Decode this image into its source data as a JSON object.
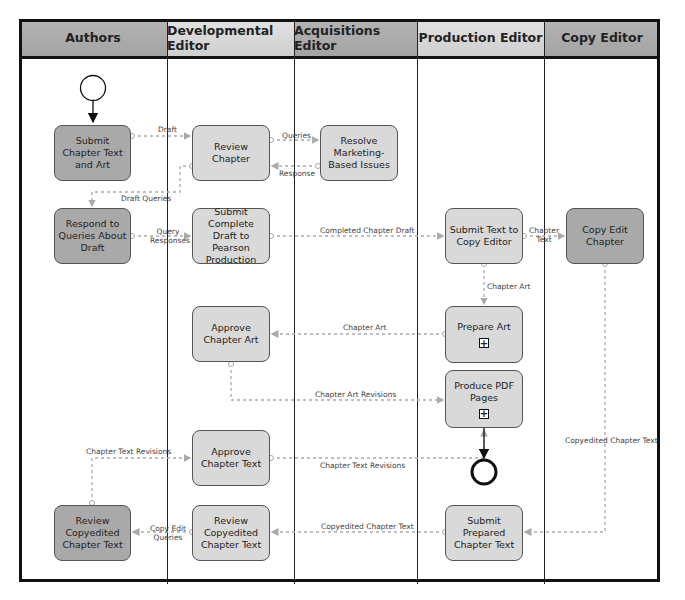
{
  "lanes": [
    {
      "name": "Authors",
      "shade": "dark"
    },
    {
      "name": "Developmental Editor",
      "shade": "light"
    },
    {
      "name": "Acquisitions Editor",
      "shade": "dark"
    },
    {
      "name": "Production Editor",
      "shade": "light"
    },
    {
      "name": "Copy Editor",
      "shade": "dark"
    }
  ],
  "tasks": {
    "submit_chapter": "Submit Chapter Text and Art",
    "review_chapter": "Review Chapter",
    "resolve_marketing": "Resolve Marketing-Based Issues",
    "respond_queries": "Respond to Queries About Draft",
    "submit_complete_draft": "Submit Complete Draft to Pearson Production",
    "submit_text_copy": "Submit Text to Copy Editor",
    "copy_edit": "Copy Edit Chapter",
    "approve_art": "Approve Chapter Art",
    "prepare_art": "Prepare Art",
    "produce_pdf": "Produce PDF Pages",
    "approve_text": "Approve Chapter Text",
    "review_copyedited_author": "Review Copyedited Chapter Text",
    "review_copyedited_dev": "Review Copyedited Chapter Text",
    "submit_prepared": "Submit Prepared Chapter Text"
  },
  "subprocess_marker": "+",
  "flows": {
    "draft": "Draft",
    "queries": "Queries",
    "response": "Response",
    "draft_queries": "Draft Queries",
    "query_responses_1": "Query",
    "query_responses_2": "Responses",
    "completed_draft": "Completed Chapter Draft",
    "chapter_text_1": "Chapter",
    "chapter_text_2": "Text",
    "chapter_art_down": "Chapter Art",
    "chapter_art_left": "Chapter Art",
    "chapter_art_revisions": "Chapter Art Revisions",
    "chapter_text_revisions_left": "Chapter Text Revisions",
    "chapter_text_revisions_right": "Chapter Text Revisions",
    "copyedited_vertical": "Copyedited Chapter Text",
    "copyedited_left": "Copyedited Chapter Text",
    "copy_edit_queries_1": "Copy Edit",
    "copy_edit_queries_2": "Queries"
  },
  "colors": {
    "header_dark": "#a9a9a9",
    "header_light": "#d9d9d9",
    "task_dark": "#a9a9a9",
    "task_light": "#d9d9d9",
    "flow": "#aaaaaa",
    "border": "#111111"
  }
}
